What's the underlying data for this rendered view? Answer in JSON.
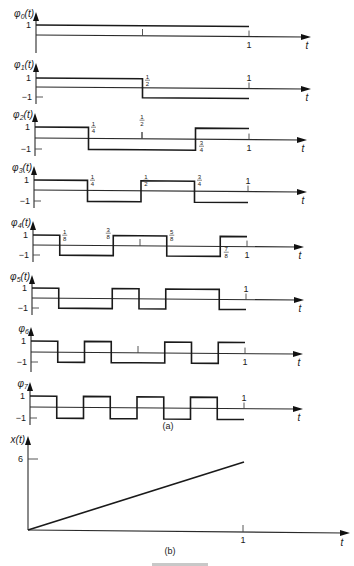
{
  "figure": {
    "caption_a": "(a)",
    "caption_b": "(b)",
    "footer_partial": "FIGURE"
  },
  "colors": {
    "ink": "#1a1a1a",
    "background": "#ffffff"
  },
  "panels": [
    {
      "name": "phi-0",
      "ylabel": "φ0(t)",
      "sub": "0",
      "fn": "t",
      "y0": 35,
      "yHigh": 25,
      "yLow": null,
      "x0": 36,
      "x1": 249,
      "axisEnd": 311,
      "top": 12,
      "bottom": 53,
      "segments": [
        1
      ],
      "yticks": [
        "1"
      ],
      "mid_tick": true,
      "one_label_below": true,
      "fractions": []
    },
    {
      "name": "phi-1",
      "ylabel": "φ1(t)",
      "sub": "1",
      "fn": "t",
      "y0": 87,
      "yHigh": 78,
      "yLow": 97,
      "x0": 36,
      "x1": 249,
      "axisEnd": 311,
      "top": 63,
      "bottom": 104,
      "segments": [
        1,
        -1
      ],
      "yticks": [
        "1",
        "−1"
      ],
      "mid_tick": false,
      "one_label_below": false,
      "fractions": [
        {
          "num": "1",
          "den": "2",
          "t": 0.5,
          "pos": "above"
        }
      ]
    },
    {
      "name": "phi-2",
      "ylabel": "φ2(t)",
      "sub": "2",
      "fn": "t",
      "y0": 138,
      "yHigh": 127,
      "yLow": 149,
      "x0": 35,
      "x1": 249,
      "axisEnd": 307,
      "top": 113,
      "bottom": 156,
      "segments": [
        1,
        -1,
        -1,
        1
      ],
      "yticks": [
        "1",
        "−1"
      ],
      "mid_tick": true,
      "one_label_below": true,
      "fractions": [
        {
          "num": "1",
          "den": "4",
          "t": 0.25,
          "pos": "above"
        },
        {
          "num": "1",
          "den": "2",
          "t": 0.5,
          "pos": "above-high"
        },
        {
          "num": "3",
          "den": "4",
          "t": 0.75,
          "pos": "below"
        }
      ]
    },
    {
      "name": "phi-3",
      "ylabel": "φ3(t)",
      "sub": "3",
      "fn": "t",
      "y0": 190,
      "yHigh": 180,
      "yLow": 201,
      "x0": 34,
      "x1": 248,
      "axisEnd": 307,
      "top": 166,
      "bottom": 208,
      "segments": [
        1,
        -1,
        1,
        -1
      ],
      "yticks": [
        "1",
        "−1"
      ],
      "mid_tick": false,
      "one_label_below": false,
      "fractions": [
        {
          "num": "1",
          "den": "4",
          "t": 0.25,
          "pos": "above"
        },
        {
          "num": "1",
          "den": "2",
          "t": 0.5,
          "pos": "above"
        },
        {
          "num": "3",
          "den": "4",
          "t": 0.75,
          "pos": "above"
        }
      ]
    },
    {
      "name": "phi-4",
      "ylabel": "φ4(t)",
      "sub": "4",
      "fn": "t",
      "y0": 245,
      "yHigh": 235,
      "yLow": 255,
      "x0": 33,
      "x1": 247,
      "axisEnd": 304,
      "top": 221,
      "bottom": 262,
      "segments": [
        1,
        -1,
        -1,
        1,
        1,
        -1,
        -1,
        1
      ],
      "yticks": [
        "1",
        "−1"
      ],
      "mid_tick": true,
      "one_label_below": true,
      "fractions": [
        {
          "num": "1",
          "den": "8",
          "t": 0.125,
          "pos": "above"
        },
        {
          "num": "3",
          "den": "8",
          "t": 0.375,
          "pos": "above-left"
        },
        {
          "num": "5",
          "den": "8",
          "t": 0.625,
          "pos": "above"
        },
        {
          "num": "7",
          "den": "8",
          "t": 0.875,
          "pos": "below"
        }
      ]
    },
    {
      "name": "phi-5",
      "ylabel": "φ5(t)",
      "sub": "5",
      "fn": "t",
      "y0": 298,
      "yHigh": 288,
      "yLow": 308,
      "x0": 32,
      "x1": 246,
      "axisEnd": 304,
      "top": 275,
      "bottom": 315,
      "segments": [
        1,
        -1,
        -1,
        1,
        -1,
        1,
        1,
        -1
      ],
      "yticks": [
        "1",
        "−1"
      ],
      "mid_tick": false,
      "one_label_below": false,
      "fractions": []
    },
    {
      "name": "phi-6",
      "ylabel": "φ6",
      "sub": "6",
      "fn": "",
      "y0": 352,
      "yHigh": 341,
      "yLow": 362,
      "x0": 31,
      "x1": 245,
      "axisEnd": 303,
      "top": 327,
      "bottom": 372,
      "segments": [
        1,
        -1,
        1,
        -1,
        -1,
        1,
        -1,
        1
      ],
      "yticks": [
        "1",
        "−1"
      ],
      "mid_tick": true,
      "one_label_below": true,
      "fractions": []
    },
    {
      "name": "phi-7",
      "ylabel": "φ7",
      "sub": "7",
      "fn": "",
      "y0": 407,
      "yHigh": 396,
      "yLow": 418,
      "x0": 30,
      "x1": 244,
      "axisEnd": 303,
      "top": 382,
      "bottom": 425,
      "segments": [
        1,
        -1,
        1,
        -1,
        1,
        -1,
        1,
        -1
      ],
      "yticks": [
        "1",
        "−1"
      ],
      "mid_tick": false,
      "one_label_below": false,
      "fractions": []
    }
  ],
  "ramp": {
    "name": "x-of-t",
    "ylabel": "x(t)",
    "x0": 28,
    "y0": 530,
    "x1": 243,
    "axisEnd": 350,
    "top": 436,
    "y_at_1": 462,
    "y6": 459,
    "ytick": "6",
    "xtick": "1",
    "t_label": "t"
  },
  "common": {
    "t_label": "t",
    "one": "1"
  }
}
